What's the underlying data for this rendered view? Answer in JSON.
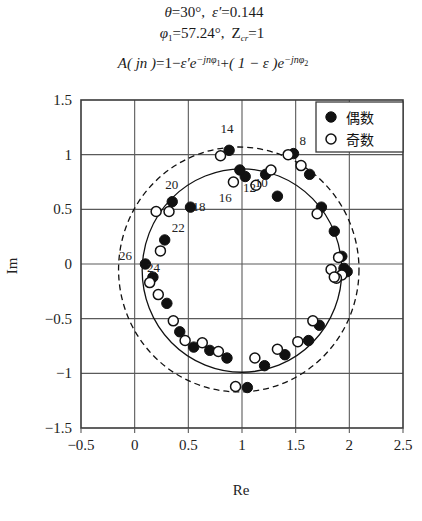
{
  "header": {
    "line1": {
      "theta_sym": "θ",
      "theta_val": "30°",
      "eps_sym": "ε′",
      "eps_val": "0.144"
    },
    "line2": {
      "phi_sym": "φ",
      "phi_sub": "1",
      "phi_val": "57.24°",
      "z_sym": "Z",
      "z_sub": "cr",
      "z_val": "1"
    },
    "line3": {
      "lhs": "A",
      "arg": "( jn )",
      "eq": "=",
      "term1": "1",
      "minus": "−",
      "eps1": "ε′",
      "exp1_base": "e",
      "exp1_sup": "−jnφ",
      "exp1_sup_sub": "1",
      "plus": "+",
      "paren": "( 1 − ε )",
      "exp2_base": "e",
      "exp2_sup": "−jnφ",
      "exp2_sup_sub": "2"
    }
  },
  "legend": {
    "title": "",
    "items": [
      {
        "marker": "filled-circle-marker",
        "label": "偶数"
      },
      {
        "marker": "open-circle-marker",
        "label": "奇数"
      }
    ]
  },
  "axes": {
    "xlabel": "Re",
    "ylabel": "Im",
    "xticks": [
      "−0.5",
      "0",
      "0.5",
      "1",
      "1.5",
      "2",
      "2.5"
    ],
    "yticks": [
      "1.5",
      "1",
      "0.5",
      "0",
      "−0.5",
      "−1",
      "−1.5"
    ]
  },
  "chart_data": {
    "type": "scatter",
    "title": "",
    "xlabel": "Re",
    "ylabel": "Im",
    "xlim": [
      -0.5,
      2.5
    ],
    "ylim": [
      -1.5,
      1.5
    ],
    "xticks": [
      -0.5,
      0,
      0.5,
      1,
      1.5,
      2,
      2.5
    ],
    "yticks": [
      -1.5,
      -1,
      -0.5,
      0,
      0.5,
      1,
      1.5
    ],
    "grid": true,
    "legend_position": "top-right",
    "annotations": [
      {
        "text": "8",
        "x": 1.565,
        "y": 1.09
      },
      {
        "text": "10",
        "x": 1.18,
        "y": 0.7
      },
      {
        "text": "12",
        "x": 1.07,
        "y": 0.66
      },
      {
        "text": "14",
        "x": 0.86,
        "y": 1.2
      },
      {
        "text": "16",
        "x": 0.845,
        "y": 0.565
      },
      {
        "text": "18",
        "x": 0.6,
        "y": 0.485
      },
      {
        "text": "20",
        "x": 0.345,
        "y": 0.685
      },
      {
        "text": "22",
        "x": 0.405,
        "y": 0.295
      },
      {
        "text": "24",
        "x": 0.175,
        "y": -0.075
      },
      {
        "text": "26",
        "x": -0.085,
        "y": 0.035
      }
    ],
    "series": [
      {
        "name": "偶数",
        "marker": "filled-circle",
        "points": [
          [
            1.86,
            0.3
          ],
          [
            1.93,
            0.07
          ],
          [
            1.95,
            -0.04
          ],
          [
            1.98,
            -0.07
          ],
          [
            1.72,
            -0.56
          ],
          [
            1.62,
            -0.7
          ],
          [
            1.4,
            -0.83
          ],
          [
            1.21,
            -0.93
          ],
          [
            1.05,
            -1.13
          ],
          [
            0.86,
            -0.86
          ],
          [
            0.7,
            -0.79
          ],
          [
            0.55,
            -0.76
          ],
          [
            0.42,
            -0.62
          ],
          [
            0.3,
            -0.36
          ],
          [
            0.17,
            -0.12
          ],
          [
            0.1,
            0.0
          ],
          [
            0.28,
            0.22
          ],
          [
            0.35,
            0.57
          ],
          [
            0.52,
            0.52
          ],
          [
            0.88,
            1.04
          ],
          [
            1.03,
            0.8
          ],
          [
            0.98,
            0.86
          ],
          [
            1.22,
            0.82
          ],
          [
            1.33,
            0.62
          ],
          [
            1.48,
            1.01
          ],
          [
            1.63,
            0.82
          ],
          [
            1.74,
            0.52
          ]
        ]
      },
      {
        "name": "奇数",
        "marker": "open-circle",
        "points": [
          [
            1.9,
            0.06
          ],
          [
            1.93,
            -0.1
          ],
          [
            1.88,
            -0.13
          ],
          [
            1.66,
            -0.52
          ],
          [
            1.52,
            -0.71
          ],
          [
            1.33,
            -0.78
          ],
          [
            1.12,
            -0.86
          ],
          [
            0.94,
            -1.12
          ],
          [
            0.78,
            -0.8
          ],
          [
            0.63,
            -0.72
          ],
          [
            0.47,
            -0.7
          ],
          [
            0.36,
            -0.52
          ],
          [
            0.22,
            -0.28
          ],
          [
            0.14,
            -0.17
          ],
          [
            0.24,
            0.12
          ],
          [
            0.2,
            0.48
          ],
          [
            0.32,
            0.48
          ],
          [
            0.8,
            0.99
          ],
          [
            0.92,
            0.75
          ],
          [
            1.13,
            0.72
          ],
          [
            1.27,
            0.86
          ],
          [
            1.43,
            1.0
          ],
          [
            1.55,
            0.9
          ],
          [
            1.7,
            0.46
          ],
          [
            1.83,
            -0.05
          ],
          [
            1.86,
            -0.12
          ]
        ]
      }
    ],
    "loci": [
      {
        "name": "solid-locus",
        "style": "solid",
        "center": [
          1.0,
          -0.06
        ],
        "rx": 0.93,
        "ry": 0.93
      },
      {
        "name": "dashed-locus",
        "style": "dashed",
        "center": [
          0.97,
          -0.05
        ],
        "rx": 1.12,
        "ry": 1.12
      }
    ]
  }
}
